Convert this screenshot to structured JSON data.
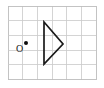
{
  "figure": {
    "type": "geometry-grid-diagram",
    "background_color": "#ffffff"
  },
  "grid": {
    "name": "square-grid",
    "columns": 6,
    "rows": 5,
    "cell_size": 14.7,
    "origin_x": 8,
    "origin_y": 6,
    "line_color": "#c9c9c9",
    "edge_color": "#bdbdbd",
    "width": 88.2,
    "height": 73.5
  },
  "labels": {
    "point_o": "O"
  },
  "points": [
    {
      "name": "point-o",
      "label": "O",
      "dot_x": 26,
      "dot_y": 43,
      "dot_radius": 2.0,
      "label_x": 16,
      "label_y": 52,
      "color": "#0d0d0d"
    }
  ],
  "shapes": [
    {
      "name": "triangle",
      "kind": "triangle",
      "orientation": "points-right",
      "stroke_color": "#1a1a1a",
      "stroke_width": 1.7,
      "fill": "none",
      "vertices": [
        {
          "name": "top-vertex",
          "x": 44,
          "y": 22
        },
        {
          "name": "right-vertex",
          "x": 63,
          "y": 44
        },
        {
          "name": "bottom-vertex",
          "x": 44,
          "y": 64
        }
      ],
      "points_attr": "44,22 63,44 44,64"
    }
  ]
}
